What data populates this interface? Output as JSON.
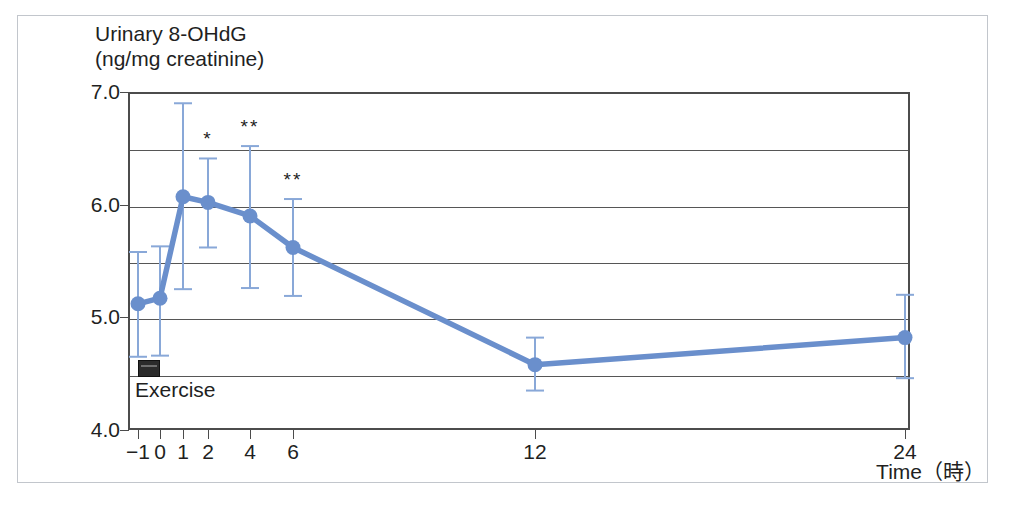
{
  "figure": {
    "exercise_marker": {
      "label": "Exercise",
      "x_start": -1,
      "x_end": 0,
      "y": 4.5,
      "color": "#2b2b2b"
    }
  },
  "chart_data": {
    "type": "line",
    "title": "",
    "ylabel_line1": "Urinary 8-OHdG",
    "ylabel_line2": "(ng/mg creatinine)",
    "xlabel": "Time（時）",
    "x": [
      -1,
      0,
      1,
      2,
      4,
      6,
      12,
      24
    ],
    "x_tick_labels": [
      "−1",
      "0",
      "1",
      "2",
      "4",
      "6",
      "12",
      "24"
    ],
    "values": [
      5.12,
      5.17,
      6.07,
      6.02,
      5.9,
      5.62,
      4.58,
      4.82
    ],
    "error_low": [
      4.65,
      4.66,
      5.25,
      5.62,
      5.26,
      5.19,
      4.35,
      4.46
    ],
    "error_high": [
      5.58,
      5.63,
      6.9,
      6.41,
      6.52,
      6.05,
      4.82,
      5.2
    ],
    "significance": [
      "",
      "",
      "",
      "*",
      "**",
      "**",
      "",
      ""
    ],
    "ylim": [
      4.0,
      7.0
    ],
    "y_ticks": [
      4.0,
      4.5,
      5.0,
      5.5,
      6.0,
      6.5,
      7.0
    ],
    "y_tick_labels": [
      "4.0",
      "",
      "5.0",
      "",
      "6.0",
      "",
      "7.0"
    ],
    "grid": true,
    "legend": "none",
    "series_color": "#6a8fcc",
    "errorbar_color": "#89a8d8",
    "marker": "circle"
  }
}
